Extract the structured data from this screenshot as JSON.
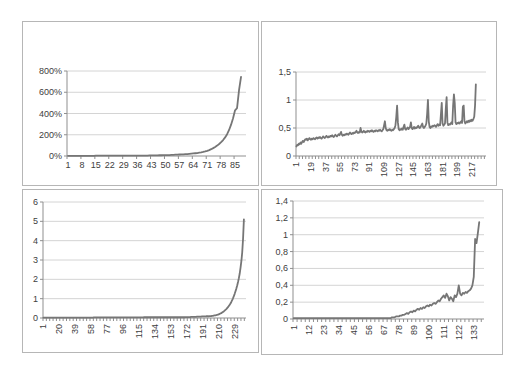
{
  "page": {
    "background_color": "#ffffff",
    "panel_border_color": "#b6b6b6",
    "gridline_color": "#d4d4d4",
    "axis_color": "#8f8f8f",
    "series_color": "#767676",
    "text_color": "#404040"
  },
  "chart_data": [
    {
      "type": "line",
      "title": "",
      "xlabel": "",
      "ylabel": "",
      "grid": true,
      "legend": "none",
      "x_label_rotation": 0,
      "ylim": [
        0,
        800
      ],
      "y_tick_labels": [
        "0%",
        "200%",
        "400%",
        "600%",
        "800%"
      ],
      "y_tick_values": [
        0,
        200,
        400,
        600,
        800
      ],
      "x_tick_labels": [
        "1",
        "8",
        "15",
        "22",
        "29",
        "36",
        "43",
        "50",
        "57",
        "64",
        "71",
        "78",
        "85"
      ],
      "values": [
        2,
        2,
        2,
        2,
        2,
        2,
        2,
        2,
        2,
        2,
        2,
        2,
        2,
        2,
        3,
        3,
        3,
        3,
        3,
        3,
        3,
        3,
        3,
        3,
        3,
        3,
        3,
        3,
        3,
        3,
        3,
        3,
        3,
        3,
        4,
        4,
        4,
        4,
        4,
        4,
        4,
        5,
        5,
        5,
        6,
        6,
        7,
        7,
        8,
        8,
        9,
        9,
        10,
        11,
        12,
        13,
        14,
        15,
        16,
        17,
        18,
        20,
        22,
        24,
        26,
        28,
        31,
        34,
        38,
        43,
        49,
        56,
        64,
        74,
        85,
        98,
        113,
        130,
        150,
        175,
        205,
        245,
        295,
        355,
        430,
        450,
        620,
        745
      ]
    },
    {
      "type": "line",
      "title": "",
      "xlabel": "",
      "ylabel": "",
      "grid": true,
      "legend": "none",
      "x_label_rotation": -90,
      "ylim": [
        0,
        1.5
      ],
      "y_tick_labels": [
        "0",
        "0,5",
        "1",
        "1,5"
      ],
      "y_tick_values": [
        0,
        0.5,
        1,
        1.5
      ],
      "x_tick_labels": [
        "1",
        "19",
        "37",
        "55",
        "73",
        "91",
        "109",
        "127",
        "145",
        "163",
        "181",
        "199",
        "217"
      ],
      "values": [
        0.17,
        0.2,
        0.19,
        0.22,
        0.21,
        0.24,
        0.22,
        0.25,
        0.27,
        0.25,
        0.28,
        0.3,
        0.29,
        0.31,
        0.28,
        0.3,
        0.32,
        0.3,
        0.29,
        0.31,
        0.3,
        0.32,
        0.31,
        0.3,
        0.32,
        0.33,
        0.31,
        0.33,
        0.32,
        0.34,
        0.32,
        0.31,
        0.33,
        0.35,
        0.33,
        0.32,
        0.34,
        0.36,
        0.34,
        0.33,
        0.35,
        0.34,
        0.36,
        0.35,
        0.37,
        0.35,
        0.34,
        0.36,
        0.38,
        0.36,
        0.35,
        0.37,
        0.39,
        0.37,
        0.4,
        0.43,
        0.38,
        0.36,
        0.38,
        0.37,
        0.39,
        0.38,
        0.4,
        0.39,
        0.38,
        0.4,
        0.42,
        0.4,
        0.39,
        0.41,
        0.4,
        0.42,
        0.41,
        0.43,
        0.45,
        0.42,
        0.41,
        0.43,
        0.42,
        0.5,
        0.44,
        0.42,
        0.43,
        0.45,
        0.43,
        0.42,
        0.44,
        0.43,
        0.45,
        0.44,
        0.43,
        0.45,
        0.44,
        0.46,
        0.44,
        0.43,
        0.45,
        0.44,
        0.46,
        0.45,
        0.44,
        0.46,
        0.45,
        0.47,
        0.45,
        0.44,
        0.46,
        0.48,
        0.55,
        0.62,
        0.5,
        0.46,
        0.45,
        0.47,
        0.46,
        0.48,
        0.46,
        0.45,
        0.47,
        0.46,
        0.48,
        0.5,
        0.55,
        0.7,
        0.9,
        0.6,
        0.48,
        0.46,
        0.48,
        0.47,
        0.49,
        0.47,
        0.52,
        0.56,
        0.48,
        0.47,
        0.49,
        0.51,
        0.48,
        0.5,
        0.52,
        0.6,
        0.5,
        0.48,
        0.5,
        0.52,
        0.49,
        0.51,
        0.5,
        0.52,
        0.54,
        0.51,
        0.5,
        0.52,
        0.55,
        0.58,
        0.52,
        0.5,
        0.52,
        0.54,
        0.58,
        0.75,
        1.0,
        0.62,
        0.52,
        0.5,
        0.53,
        0.52,
        0.54,
        0.53,
        0.55,
        0.54,
        0.52,
        0.55,
        0.57,
        0.54,
        0.56,
        0.55,
        0.75,
        0.95,
        0.58,
        0.54,
        0.56,
        0.58,
        0.85,
        1.05,
        0.6,
        0.55,
        0.57,
        0.56,
        0.58,
        0.6,
        0.57,
        0.9,
        1.1,
        0.95,
        0.6,
        0.57,
        0.59,
        0.58,
        0.6,
        0.58,
        0.6,
        0.62,
        0.59,
        0.88,
        0.9,
        0.62,
        0.58,
        0.6,
        0.62,
        0.6,
        0.63,
        0.61,
        0.64,
        0.62,
        0.65,
        0.63,
        0.66,
        0.7,
        0.9,
        1.28
      ]
    },
    {
      "type": "line",
      "title": "",
      "xlabel": "",
      "ylabel": "",
      "grid": true,
      "legend": "none",
      "x_label_rotation": -90,
      "ylim": [
        0,
        6
      ],
      "y_tick_labels": [
        "0",
        "1",
        "2",
        "3",
        "4",
        "5",
        "6"
      ],
      "y_tick_values": [
        0,
        1,
        2,
        3,
        4,
        5,
        6
      ],
      "x_tick_labels": [
        "1",
        "20",
        "39",
        "58",
        "77",
        "96",
        "115",
        "134",
        "153",
        "172",
        "191",
        "210",
        "229"
      ],
      "values": [
        0.02,
        0.02,
        0.02,
        0.02,
        0.02,
        0.02,
        0.02,
        0.02,
        0.02,
        0.02,
        0.02,
        0.02,
        0.02,
        0.02,
        0.02,
        0.02,
        0.02,
        0.02,
        0.02,
        0.02,
        0.02,
        0.02,
        0.02,
        0.02,
        0.02,
        0.02,
        0.02,
        0.02,
        0.02,
        0.02,
        0.02,
        0.02,
        0.02,
        0.02,
        0.02,
        0.02,
        0.02,
        0.02,
        0.02,
        0.02,
        0.02,
        0.02,
        0.02,
        0.02,
        0.02,
        0.02,
        0.02,
        0.02,
        0.02,
        0.02,
        0.02,
        0.02,
        0.02,
        0.02,
        0.02,
        0.02,
        0.02,
        0.02,
        0.02,
        0.02,
        0.03,
        0.03,
        0.03,
        0.03,
        0.03,
        0.03,
        0.03,
        0.03,
        0.03,
        0.03,
        0.03,
        0.03,
        0.03,
        0.03,
        0.03,
        0.03,
        0.03,
        0.03,
        0.03,
        0.03,
        0.03,
        0.03,
        0.03,
        0.03,
        0.03,
        0.03,
        0.03,
        0.03,
        0.03,
        0.03,
        0.03,
        0.03,
        0.03,
        0.03,
        0.03,
        0.03,
        0.03,
        0.03,
        0.03,
        0.03,
        0.03,
        0.03,
        0.03,
        0.03,
        0.03,
        0.03,
        0.03,
        0.03,
        0.03,
        0.03,
        0.03,
        0.03,
        0.03,
        0.03,
        0.03,
        0.03,
        0.03,
        0.03,
        0.03,
        0.03,
        0.04,
        0.04,
        0.04,
        0.04,
        0.04,
        0.04,
        0.04,
        0.04,
        0.04,
        0.04,
        0.04,
        0.04,
        0.04,
        0.04,
        0.04,
        0.04,
        0.04,
        0.04,
        0.04,
        0.04,
        0.04,
        0.04,
        0.04,
        0.04,
        0.04,
        0.04,
        0.04,
        0.04,
        0.04,
        0.04,
        0.04,
        0.04,
        0.04,
        0.04,
        0.04,
        0.04,
        0.04,
        0.04,
        0.04,
        0.04,
        0.04,
        0.04,
        0.04,
        0.04,
        0.04,
        0.04,
        0.04,
        0.04,
        0.04,
        0.04,
        0.05,
        0.05,
        0.05,
        0.05,
        0.05,
        0.05,
        0.06,
        0.06,
        0.06,
        0.06,
        0.06,
        0.06,
        0.06,
        0.07,
        0.07,
        0.07,
        0.07,
        0.07,
        0.07,
        0.08,
        0.08,
        0.08,
        0.08,
        0.08,
        0.09,
        0.09,
        0.09,
        0.09,
        0.1,
        0.1,
        0.1,
        0.11,
        0.11,
        0.12,
        0.13,
        0.14,
        0.15,
        0.16,
        0.17,
        0.19,
        0.21,
        0.23,
        0.25,
        0.28,
        0.31,
        0.34,
        0.38,
        0.42,
        0.46,
        0.51,
        0.56,
        0.62,
        0.68,
        0.75,
        0.83,
        0.92,
        1.02,
        1.13,
        1.25,
        1.38,
        1.52,
        1.68,
        1.86,
        2.06,
        2.3,
        2.6,
        2.95,
        3.4,
        4.1,
        5.1
      ]
    },
    {
      "type": "line",
      "title": "",
      "xlabel": "",
      "ylabel": "",
      "grid": true,
      "legend": "none",
      "x_label_rotation": -90,
      "ylim": [
        0,
        1.4
      ],
      "y_tick_labels": [
        "0",
        "0,2",
        "0,4",
        "0,6",
        "0,8",
        "1",
        "1,2",
        "1,4"
      ],
      "y_tick_values": [
        0,
        0.2,
        0.4,
        0.6,
        0.8,
        1,
        1.2,
        1.4
      ],
      "x_tick_labels": [
        "1",
        "12",
        "23",
        "34",
        "45",
        "56",
        "67",
        "78",
        "89",
        "100",
        "111",
        "122",
        "133"
      ],
      "values": [
        0.01,
        0.01,
        0.01,
        0.01,
        0.01,
        0.01,
        0.01,
        0.01,
        0.01,
        0.01,
        0.01,
        0.01,
        0.01,
        0.01,
        0.01,
        0.01,
        0.01,
        0.01,
        0.01,
        0.01,
        0.01,
        0.01,
        0.01,
        0.01,
        0.01,
        0.01,
        0.01,
        0.01,
        0.01,
        0.01,
        0.01,
        0.01,
        0.01,
        0.01,
        0.01,
        0.01,
        0.01,
        0.01,
        0.01,
        0.01,
        0.01,
        0.01,
        0.01,
        0.01,
        0.01,
        0.01,
        0.01,
        0.01,
        0.01,
        0.01,
        0.01,
        0.01,
        0.01,
        0.01,
        0.01,
        0.01,
        0.01,
        0.01,
        0.01,
        0.01,
        0.01,
        0.01,
        0.01,
        0.01,
        0.01,
        0.01,
        0.01,
        0.01,
        0.01,
        0.01,
        0.01,
        0.01,
        0.02,
        0.02,
        0.02,
        0.03,
        0.03,
        0.03,
        0.04,
        0.04,
        0.05,
        0.05,
        0.06,
        0.07,
        0.06,
        0.08,
        0.09,
        0.08,
        0.1,
        0.09,
        0.11,
        0.12,
        0.11,
        0.13,
        0.12,
        0.14,
        0.13,
        0.15,
        0.16,
        0.15,
        0.17,
        0.16,
        0.18,
        0.19,
        0.18,
        0.2,
        0.22,
        0.21,
        0.24,
        0.26,
        0.28,
        0.25,
        0.3,
        0.27,
        0.22,
        0.26,
        0.24,
        0.21,
        0.28,
        0.26,
        0.3,
        0.4,
        0.3,
        0.28,
        0.31,
        0.3,
        0.32,
        0.31,
        0.33,
        0.34,
        0.36,
        0.4,
        0.5,
        0.95,
        0.9,
        1.02,
        1.15
      ]
    }
  ]
}
